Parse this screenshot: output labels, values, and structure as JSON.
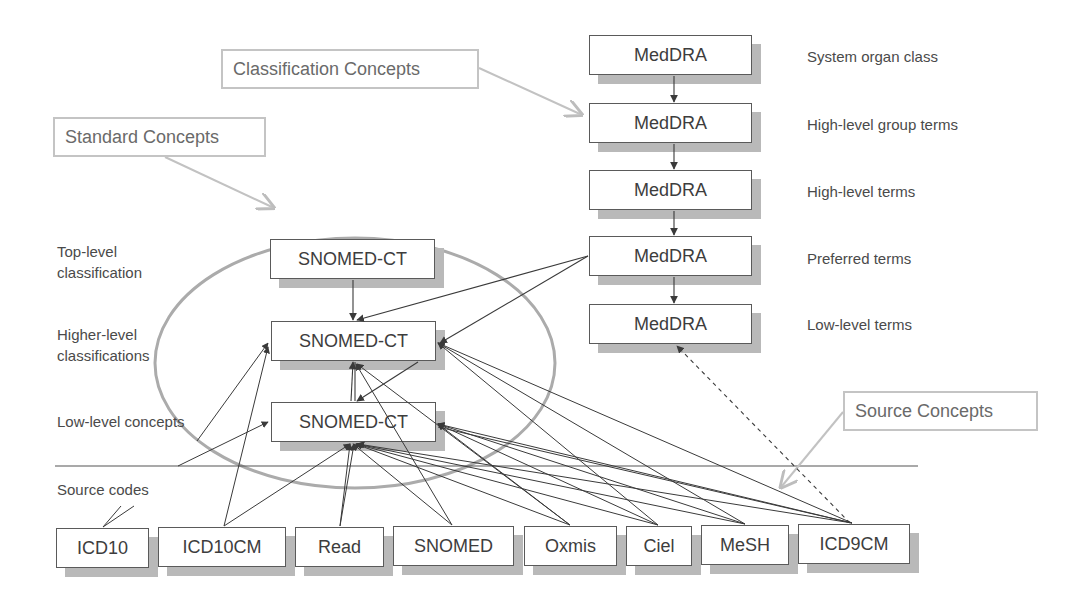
{
  "diagram": {
    "callouts": {
      "classification": "Classification Concepts",
      "standard": "Standard Concepts",
      "source": "Source Concepts"
    },
    "medDRA": {
      "nodes": [
        {
          "label": "MedDRA",
          "level": "System organ class"
        },
        {
          "label": "MedDRA",
          "level": "High-level group terms"
        },
        {
          "label": "MedDRA",
          "level": "High-level terms"
        },
        {
          "label": "MedDRA",
          "level": "Preferred terms"
        },
        {
          "label": "MedDRA",
          "level": "Low-level terms"
        }
      ]
    },
    "snomed": {
      "nodes": [
        {
          "label": "SNOMED-CT"
        },
        {
          "label": "SNOMED-CT"
        },
        {
          "label": "SNOMED-CT"
        }
      ],
      "level_labels": [
        "Top-level\nclassification",
        "Higher-level\nclassifications",
        "Low-level concepts"
      ]
    },
    "source_codes_label": "Source codes",
    "sources": [
      {
        "label": "ICD10"
      },
      {
        "label": "ICD10CM"
      },
      {
        "label": "Read"
      },
      {
        "label": "SNOMED"
      },
      {
        "label": "Oxmis"
      },
      {
        "label": "Ciel"
      },
      {
        "label": "MeSH"
      },
      {
        "label": "ICD9CM"
      }
    ],
    "colors": {
      "box_border": "#5a5a5a",
      "shadow": "#b9b9b9",
      "callout_border": "#c4c4c4",
      "callout_arrow": "#bdbdbd",
      "ellipse": "#a8a8a8",
      "link": "#444444"
    }
  }
}
